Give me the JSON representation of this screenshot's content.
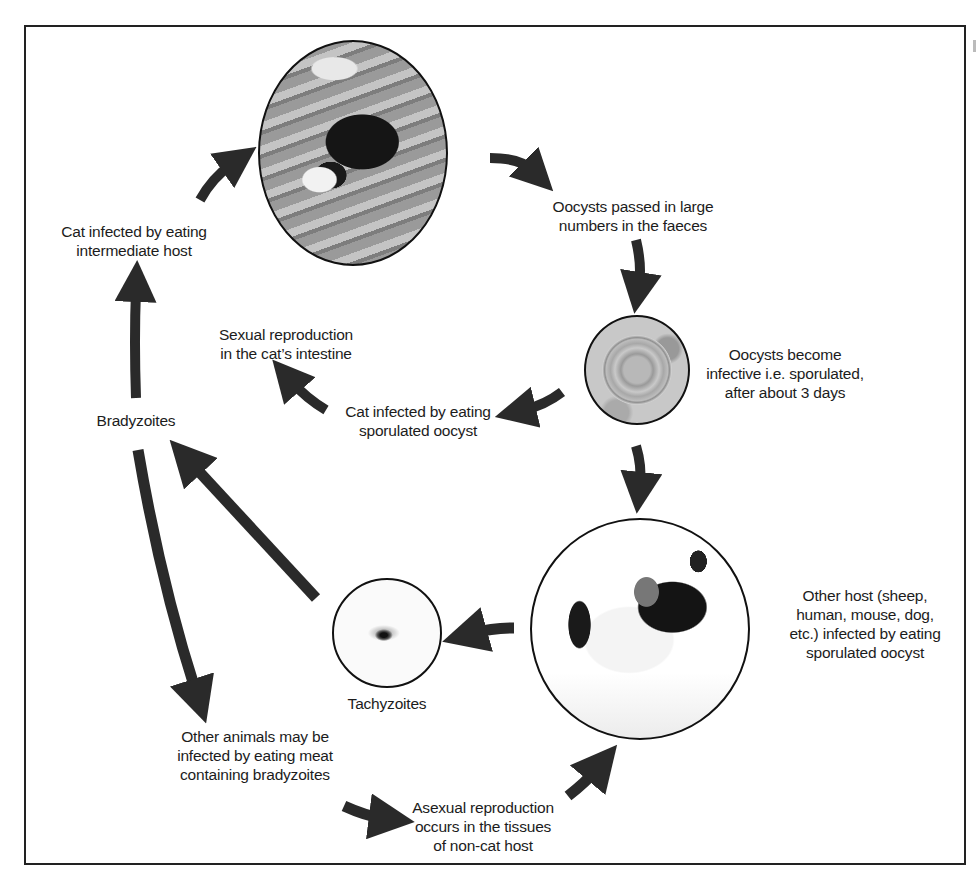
{
  "diagram": {
    "colors": {
      "border": "#222222",
      "arrow": "#2a2a2a",
      "text": "#1c1c1c",
      "background": "#ffffff"
    },
    "images": [
      {
        "id": "cat",
        "description": "black-and-white cat crouching on wooden deck"
      },
      {
        "id": "oocyst",
        "description": "microscope image of sporulated oocyst"
      },
      {
        "id": "mouse",
        "description": "black-and-white mouse"
      },
      {
        "id": "tachyzoite",
        "description": "microscope image of tachyzoite"
      }
    ],
    "labels": {
      "cat_infected_intermediate": [
        "Cat infected by eating",
        "intermediate host"
      ],
      "oocysts_passed": [
        "Oocysts passed in large",
        "numbers in the faeces"
      ],
      "sexual_reproduction": [
        "Sexual reproduction",
        "in the cat’s intestine"
      ],
      "oocysts_become_infective": [
        "Oocysts become",
        "infective i.e. sporulated,",
        "after about 3 days"
      ],
      "cat_infected_oocyst": [
        "Cat infected by eating",
        "sporulated oocyst"
      ],
      "bradyzoites": [
        "Bradyzoites"
      ],
      "other_host": [
        "Other host (sheep,",
        "human, mouse, dog,",
        "etc.) infected by eating",
        "sporulated oocyst"
      ],
      "tachyzoites": [
        "Tachyzoites"
      ],
      "other_animals": [
        "Other animals may be",
        "infected by eating meat",
        "containing bradyzoites"
      ],
      "asexual_reproduction": [
        "Asexual reproduction",
        "occurs in the tissues",
        "of non-cat host"
      ]
    },
    "flow": [
      {
        "from": "cat_infected_intermediate",
        "to": "cat"
      },
      {
        "from": "cat",
        "to": "oocysts_passed"
      },
      {
        "from": "oocysts_passed",
        "to": "oocyst"
      },
      {
        "from": "oocyst",
        "to": "cat_infected_oocyst"
      },
      {
        "from": "cat_infected_oocyst",
        "to": "sexual_reproduction"
      },
      {
        "from": "oocyst",
        "to": "mouse"
      },
      {
        "from": "mouse",
        "to": "tachyzoite"
      },
      {
        "from": "tachyzoite",
        "to": "bradyzoites"
      },
      {
        "from": "bradyzoites",
        "to": "cat_infected_intermediate"
      },
      {
        "from": "bradyzoites",
        "to": "other_animals"
      },
      {
        "from": "other_animals",
        "to": "asexual_reproduction"
      },
      {
        "from": "asexual_reproduction",
        "to": "mouse"
      }
    ]
  }
}
